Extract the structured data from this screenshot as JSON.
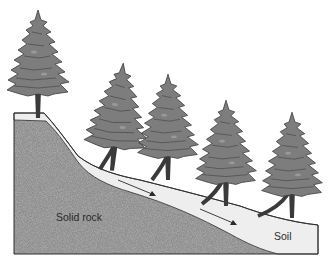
{
  "diagram": {
    "labels": {
      "rock": "Solid rock",
      "soil": "Soil"
    },
    "elements": [
      {
        "name": "solid-rock",
        "description": "Bedrock underlying slope, dark grey stippled"
      },
      {
        "name": "soil-layer",
        "description": "Light grey soil layer lying on the rock, thickening downslope"
      },
      {
        "name": "trees",
        "count": 5,
        "description": "Conifer trees with trunks curved downslope due to creep"
      },
      {
        "name": "arrows",
        "count": 2,
        "description": "Arrows indicating downslope movement of soil"
      }
    ],
    "colors": {
      "rock": "#8c8c8c",
      "soil": "#eeeeee",
      "tree": "#7a7a7a",
      "outline": "#333333",
      "background": "#ffffff"
    }
  }
}
